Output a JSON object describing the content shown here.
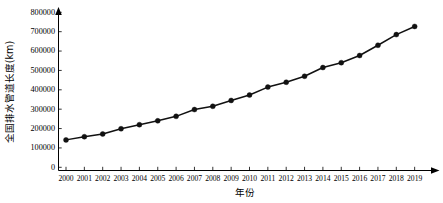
{
  "chart_data": {
    "type": "line",
    "title": "",
    "subtitle": "",
    "xlabel": "年份",
    "ylabel": "全国排水管道长度(km)",
    "x": [
      2000,
      2001,
      2002,
      2003,
      2004,
      2005,
      2006,
      2007,
      2008,
      2009,
      2010,
      2011,
      2012,
      2013,
      2014,
      2015,
      2016,
      2017,
      2018,
      2019
    ],
    "categories": [
      "2000",
      "2001",
      "2002",
      "2003",
      "2004",
      "2005",
      "2006",
      "2007",
      "2008",
      "2009",
      "2010",
      "2011",
      "2012",
      "2013",
      "2014",
      "2015",
      "2016",
      "2017",
      "2018",
      "2019"
    ],
    "values": [
      141500,
      158000,
      172000,
      199000,
      220000,
      240000,
      263000,
      298000,
      315000,
      345000,
      373000,
      414000,
      439000,
      470000,
      515000,
      540000,
      577000,
      630000,
      685000,
      727000
    ],
    "series": [
      {
        "name": "全国排水管道长度",
        "values": [
          141500,
          158000,
          172000,
          199000,
          220000,
          240000,
          263000,
          298000,
          315000,
          345000,
          373000,
          414000,
          439000,
          470000,
          515000,
          540000,
          577000,
          630000,
          685000,
          727000
        ]
      }
    ],
    "ylim": [
      0,
      800000
    ],
    "yticks": [
      0,
      100000,
      200000,
      300000,
      400000,
      500000,
      600000,
      700000,
      800000
    ],
    "ytick_labels": [
      "0",
      "100000",
      "200000",
      "300000",
      "400000",
      "500000",
      "600000",
      "700000",
      "800000"
    ],
    "xlim": [
      2000,
      2019
    ],
    "grid": false,
    "legend": "none",
    "marker": "filled-circle",
    "line_color": "#111111",
    "marker_color": "#111111",
    "axis_color": "#000000",
    "background_color": "#ffffff"
  },
  "axes": {
    "y_axis_title": "全国排水管道长度(km)",
    "x_axis_title": "年份"
  }
}
